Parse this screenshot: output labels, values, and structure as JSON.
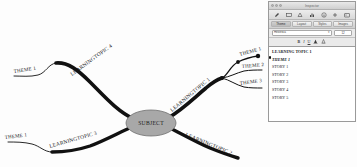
{
  "document": {
    "type": "mind-map",
    "canvas_background": "#fdfdfd",
    "line_color": "#111111",
    "node_fill": "#a8a8a8"
  },
  "map": {
    "center_node": {
      "label": "SUBJECT"
    },
    "branches": [
      {
        "id": "lt4",
        "label": "LEARNINGTOPIC 4",
        "side": "upper-left",
        "children": [
          {
            "label": "THEME 1"
          }
        ]
      },
      {
        "id": "lt3",
        "label": "LEARNINGTOPIC 3",
        "side": "lower-left",
        "children": [
          {
            "label": "THEME 1"
          }
        ]
      },
      {
        "id": "lt1",
        "label": "LEARNINGTOPIC 1",
        "side": "upper-right",
        "children": [
          {
            "label": "THEME 1"
          },
          {
            "label": "THEME 2"
          },
          {
            "label": "THEME 3"
          }
        ]
      },
      {
        "id": "lt2",
        "label": "LEARNINGTOPIC 2",
        "side": "lower-right",
        "children": []
      }
    ]
  },
  "panel": {
    "window_title": "Inspector",
    "traffic_lights": [
      "close-button",
      "minimize-button",
      "zoom-button"
    ],
    "toolbar": {
      "icons": [
        {
          "name": "pencil-icon"
        },
        {
          "name": "text-box-icon"
        },
        {
          "name": "shapes-icon"
        },
        {
          "name": "chart-icon"
        },
        {
          "name": "info-icon"
        },
        {
          "name": "add-icon"
        },
        {
          "name": "media-icon"
        }
      ]
    },
    "tabs": [
      {
        "label": "Theme",
        "active": true
      },
      {
        "label": "Layout",
        "active": false
      },
      {
        "label": "Styles",
        "active": false
      },
      {
        "label": "Images",
        "active": false
      }
    ],
    "font_controls": {
      "font_family_value": "Helvetica",
      "font_size_value": "12",
      "bold_label": "B",
      "italic_label": "I",
      "underline_label": "U",
      "text_color_label": "A",
      "fill_color_label": "A"
    },
    "outline": {
      "rows": [
        {
          "text": "LEARNING TOPIC 1",
          "style": "topic"
        },
        {
          "text": "THEME 1",
          "style": "theme"
        },
        {
          "text": "STORY 1",
          "style": "story"
        },
        {
          "text": "STORY 2",
          "style": "story"
        },
        {
          "text": "STORY 3",
          "style": "story"
        },
        {
          "text": "STORY 4",
          "style": "story"
        },
        {
          "text": "STORY 5",
          "style": "story"
        }
      ]
    }
  }
}
